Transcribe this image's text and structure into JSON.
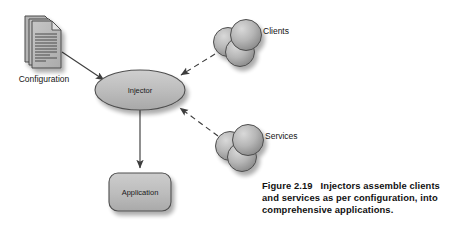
{
  "figure": {
    "caption_label": "Figure 2.19",
    "caption_line1_text": "Injectors assemble clients",
    "caption_line2": "and services as per configuration, into",
    "caption_line3": "comprehensive applications.",
    "caption_full": "Figure 2.19 Injectors assemble clients and services as per configuration, into comprehensive applications."
  },
  "diagram": {
    "type": "node-link-diagram",
    "nodes": [
      {
        "id": "configuration",
        "label": "Configuration",
        "shape": "document-stack-icon",
        "x": 44,
        "y": 42,
        "label_x": 44,
        "label_y": 79
      },
      {
        "id": "injector",
        "label": "Injector",
        "shape": "ellipse",
        "x": 140,
        "y": 90,
        "rx": 45,
        "ry": 20
      },
      {
        "id": "clients",
        "label": "Clients",
        "shape": "sphere-cluster",
        "x": 240,
        "y": 40,
        "label_x": 262,
        "label_y": 32
      },
      {
        "id": "services",
        "label": "Services",
        "shape": "sphere-cluster",
        "x": 243,
        "y": 145,
        "label_x": 263,
        "label_y": 137
      },
      {
        "id": "application",
        "label": "Application",
        "shape": "rounded-rectangle",
        "x": 140,
        "y": 192,
        "width": 62,
        "height": 38
      }
    ],
    "edges": [
      {
        "id": "configuration-to-injector",
        "from": "configuration",
        "to": "injector",
        "style": "solid",
        "arrow": "end"
      },
      {
        "id": "clients-to-injector",
        "from": "clients",
        "to": "injector",
        "style": "dashed",
        "arrow": "end"
      },
      {
        "id": "services-to-injector",
        "from": "services",
        "to": "injector",
        "style": "dashed",
        "arrow": "end"
      },
      {
        "id": "injector-to-application",
        "from": "injector",
        "to": "application",
        "style": "solid",
        "arrow": "end"
      }
    ],
    "colors": {
      "fill_light": "#c8c8c8",
      "fill_mid": "#b0b0b0",
      "fill_dark": "#8f8f8f",
      "stroke": "#4a4a4a",
      "text": "#1a1a1a",
      "background": "#ffffff",
      "shadow": "#bdbdbd"
    }
  }
}
